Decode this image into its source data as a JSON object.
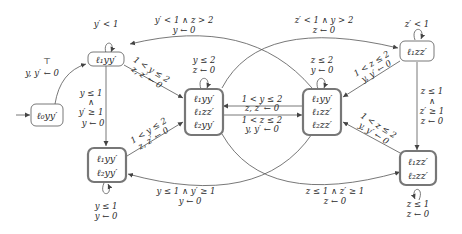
{
  "diagram": {
    "type": "automaton",
    "nodes": [
      {
        "id": "n0",
        "lines": [
          "ℓ₀yy′"
        ],
        "initial": true,
        "accepting": false
      },
      {
        "id": "n1",
        "lines": [
          "ℓ₁yy′"
        ],
        "accepting": false
      },
      {
        "id": "n2",
        "lines": [
          "ℓ₁yy′",
          "ℓ₂yy′"
        ],
        "accepting": true
      },
      {
        "id": "n3",
        "lines": [
          "ℓ₁yy′",
          "ℓ₁zz′",
          "ℓ₂yy′"
        ],
        "accepting": true
      },
      {
        "id": "n4",
        "lines": [
          "ℓ₁yy′",
          "ℓ₁zz′",
          "ℓ₂zz′"
        ],
        "accepting": true
      },
      {
        "id": "n5",
        "lines": [
          "ℓ₁zz′"
        ],
        "accepting": false
      },
      {
        "id": "n6",
        "lines": [
          "ℓ₁zz′",
          "ℓ₂zz′"
        ],
        "accepting": true
      }
    ],
    "edges": [
      {
        "from": "n0",
        "to": "n1",
        "guard": "⊤",
        "reset": "y, y′ ← 0"
      },
      {
        "from": "n1",
        "to": "n1",
        "guard": "y′ < 1",
        "reset": ""
      },
      {
        "from": "n1",
        "to": "n2",
        "guard": "y ≤ 1 ∧ y′ ≥ 1",
        "guard_lines": [
          "y ≤ 1",
          "∧",
          "y′ ≥ 1"
        ],
        "reset": "y ← 0"
      },
      {
        "from": "n1",
        "to": "n3",
        "guard": "1 < y ≤ 2",
        "reset": "z, z′ ← 0"
      },
      {
        "from": "n2",
        "to": "n2",
        "guard": "y ≤ 1",
        "reset": "y ← 0"
      },
      {
        "from": "n2",
        "to": "n3",
        "guard": "1 < y ≤ 2",
        "reset": "z, z′ ← 0"
      },
      {
        "from": "n3",
        "to": "n3",
        "guard": "y ≤ 2",
        "reset": "z ← 0"
      },
      {
        "from": "n3",
        "to": "n4",
        "guard": "1 < z ≤ 2",
        "reset": "y, y′ ← 0"
      },
      {
        "from": "n4",
        "to": "n3",
        "guard": "1 < y ≤ 2",
        "reset": "z, z′ ← 0"
      },
      {
        "from": "n4",
        "to": "n4",
        "guard": "z ≤ 2",
        "reset": "y ← 0"
      },
      {
        "from": "n4",
        "to": "n1",
        "guard": "y′ < 1 ∧ z > 2",
        "reset": "y ← 0"
      },
      {
        "from": "n3",
        "to": "n5",
        "guard": "z′ < 1 ∧ y > 2",
        "reset": "z ← 0"
      },
      {
        "from": "n4",
        "to": "n2",
        "guard": "y ≤ 1 ∧ y′ ≥ 1",
        "reset": "y ← 0"
      },
      {
        "from": "n3",
        "to": "n6",
        "guard": "z ≤ 1 ∧ z′ ≥ 1",
        "reset": "z ← 0"
      },
      {
        "from": "n5",
        "to": "n5",
        "guard": "z′ < 1",
        "reset": ""
      },
      {
        "from": "n5",
        "to": "n4",
        "guard": "1 < z ≤ 2",
        "reset": "y, y′ ← 0"
      },
      {
        "from": "n5",
        "to": "n6",
        "guard": "z ≤ 1 ∧ z′ ≥ 1",
        "guard_lines": [
          "z ≤ 1",
          "∧",
          "z′ ≥ 1"
        ],
        "reset": "z ← 0"
      },
      {
        "from": "n6",
        "to": "n6",
        "guard": "z ≤ 1",
        "reset": "z ← 0"
      },
      {
        "from": "n6",
        "to": "n4",
        "guard": "1 < z ≤ 2",
        "reset": "y, y′ ← 0"
      }
    ]
  },
  "labels": {
    "n0_1": "ℓ₀yy′",
    "n1_1": "ℓ₁yy′",
    "n2_1": "ℓ₁yy′",
    "n2_2": "ℓ₂yy′",
    "n3_1": "ℓ₁yy′",
    "n3_2": "ℓ₁zz′",
    "n3_3": "ℓ₂yy′",
    "n4_1": "ℓ₁yy′",
    "n4_2": "ℓ₁zz′",
    "n4_3": "ℓ₂zz′",
    "n5_1": "ℓ₁zz′",
    "n6_1": "ℓ₁zz′",
    "n6_2": "ℓ₂zz′",
    "e01_g": "⊤",
    "e01_r": "y, y′ ← 0",
    "e11_g": "y′ < 1",
    "e12_g1": "y ≤ 1",
    "e12_g2": "∧",
    "e12_g3": "y′ ≥ 1",
    "e12_r": "y ← 0",
    "e13_g": "1 < y ≤ 2",
    "e13_r": "z, z′ ← 0",
    "e22_g": "y ≤ 1",
    "e22_r": "y ← 0",
    "e23_g": "1 < y ≤ 2",
    "e23_r": "z, z′ ← 0",
    "e33_g": "y ≤ 2",
    "e33_r": "z ← 0",
    "e34_g": "1 < z ≤ 2",
    "e34_r": "y, y′ ← 0",
    "e43_g": "1 < y ≤ 2",
    "e43_r": "z, z′ ← 0",
    "e44_g": "z ≤ 2",
    "e44_r": "y ← 0",
    "e41_g": "y′ < 1 ∧ z > 2",
    "e41_r": "y ← 0",
    "e35_g": "z′ < 1 ∧ y > 2",
    "e35_r": "z ← 0",
    "e42_g": "y ≤ 1 ∧ y′ ≥ 1",
    "e42_r": "y ← 0",
    "e36_g": "z ≤ 1 ∧ z′ ≥ 1",
    "e36_r": "z ← 0",
    "e55_g": "z′ < 1",
    "e54_g": "1 < z ≤ 2",
    "e54_r": "y, y′ ← 0",
    "e56_g1": "z ≤ 1",
    "e56_g2": "∧",
    "e56_g3": "z′ ≥ 1",
    "e56_r": "z ← 0",
    "e66_g": "z ≤ 1",
    "e66_r": "z ← 0",
    "e64_g": "1 < z ≤ 2",
    "e64_r": "y, y′ ← 0"
  },
  "colors": {
    "stroke": "#555555",
    "accepting_stroke": "#707070",
    "text": "#2a2a2a"
  }
}
